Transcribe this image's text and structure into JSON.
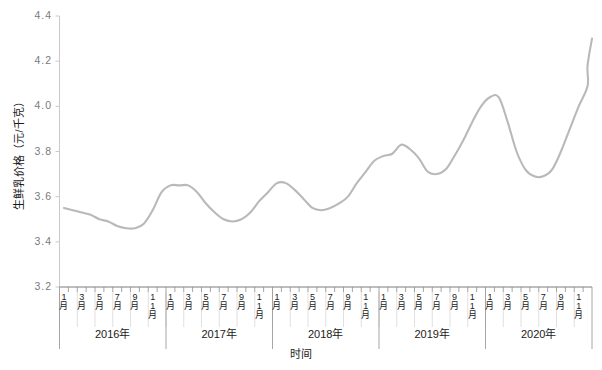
{
  "chart_data": {
    "type": "line",
    "title": "",
    "xlabel": "时间",
    "ylabel": "生鲜乳价格（元/千克）",
    "ylim": [
      3.2,
      4.4
    ],
    "yticks": [
      "3.2",
      "3.4",
      "3.6",
      "3.8",
      "4.0",
      "4.2",
      "4.4"
    ],
    "grid": false,
    "legend": "none",
    "line_color": "#b9b9b9",
    "years": [
      "2016年",
      "2017年",
      "2018年",
      "2019年",
      "2020年"
    ],
    "month_ticks": [
      "1月",
      "3月",
      "5月",
      "7月",
      "9月",
      "11月"
    ],
    "categories": [
      "2016-1",
      "2016-2",
      "2016-3",
      "2016-4",
      "2016-5",
      "2016-6",
      "2016-7",
      "2016-8",
      "2016-9",
      "2016-10",
      "2016-11",
      "2016-12",
      "2017-1",
      "2017-2",
      "2017-3",
      "2017-4",
      "2017-5",
      "2017-6",
      "2017-7",
      "2017-8",
      "2017-9",
      "2017-10",
      "2017-11",
      "2017-12",
      "2018-1",
      "2018-2",
      "2018-3",
      "2018-4",
      "2018-5",
      "2018-6",
      "2018-7",
      "2018-8",
      "2018-9",
      "2018-10",
      "2018-11",
      "2018-12",
      "2019-1",
      "2019-2",
      "2019-3",
      "2019-4",
      "2019-5",
      "2019-6",
      "2019-7",
      "2019-8",
      "2019-9",
      "2019-10",
      "2019-11",
      "2019-12",
      "2020-1",
      "2020-2",
      "2020-3",
      "2020-4",
      "2020-5",
      "2020-6",
      "2020-7",
      "2020-8",
      "2020-9",
      "2020-10",
      "2020-11",
      "2020-12"
    ],
    "series": [
      {
        "name": "生鲜乳价格",
        "values": [
          3.55,
          3.54,
          3.53,
          3.52,
          3.5,
          3.49,
          3.47,
          3.46,
          3.46,
          3.48,
          3.54,
          3.62,
          3.65,
          3.65,
          3.65,
          3.62,
          3.57,
          3.53,
          3.5,
          3.49,
          3.5,
          3.53,
          3.58,
          3.62,
          3.66,
          3.66,
          3.63,
          3.59,
          3.55,
          3.54,
          3.55,
          3.57,
          3.6,
          3.66,
          3.71,
          3.76,
          3.78,
          3.79,
          3.83,
          3.81,
          3.77,
          3.71,
          3.7,
          3.72,
          3.78,
          3.85,
          3.93,
          4.0,
          4.04,
          4.04,
          3.93,
          3.8,
          3.72,
          3.69,
          3.69,
          3.72,
          3.8,
          3.9,
          4.0,
          4.09
        ]
      }
    ],
    "extra_points": [
      {
        "x": 59.5,
        "y": 4.18
      },
      {
        "x": 60.0,
        "y": 4.3
      }
    ]
  },
  "axis": {
    "y_title": "生鲜乳价格（元/千克）",
    "x_title": "时间"
  }
}
